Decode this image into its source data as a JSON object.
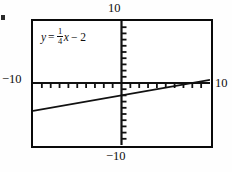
{
  "figure": {
    "background_color": "#fefefe",
    "frame_color": "#0a0a0a",
    "curve_color": "#111111"
  },
  "labels": {
    "top": "10",
    "bottom": "−10",
    "left": "−10",
    "right": "10"
  },
  "equation": {
    "lhs": "y",
    "equals": "=",
    "numerator": "1",
    "denominator": "4",
    "variable": "x",
    "constant": "− 2",
    "plain": "y = 1/4 x − 2"
  },
  "chart_data": {
    "type": "line",
    "title": "",
    "subtitle": "",
    "xlabel": "",
    "ylabel": "",
    "equation": "y = (1/4)x - 2",
    "slope": 0.25,
    "intercept": -2,
    "xlim": [
      -10,
      10
    ],
    "ylim": [
      -10,
      10
    ],
    "x_tick_step": 1,
    "y_tick_step": 1,
    "grid": false,
    "legend": false,
    "axis_ticks_drawn": true,
    "x_tick_labels": [
      "-10",
      "10"
    ],
    "y_tick_labels": [
      "-10",
      "10"
    ],
    "series": [
      {
        "name": "y = (1/4)x - 2",
        "x": [
          -10,
          -5,
          0,
          5,
          10
        ],
        "values": [
          -4.5,
          -3.25,
          -2,
          -0.75,
          0.5
        ]
      }
    ],
    "annotations": [
      {
        "text": "y = 1/4 x - 2",
        "x": -8.2,
        "y": 8.2
      }
    ]
  }
}
